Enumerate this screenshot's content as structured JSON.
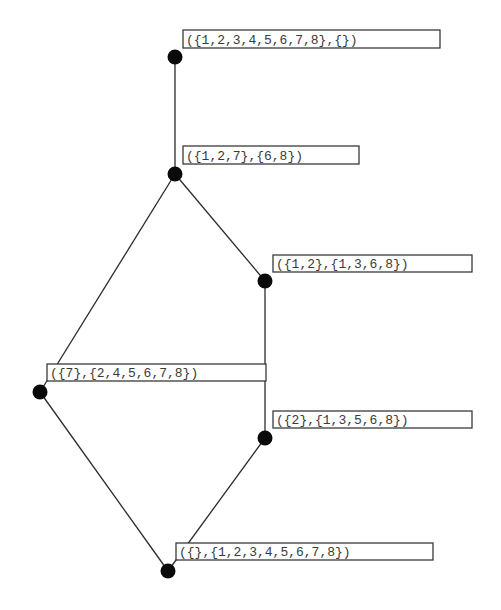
{
  "diagram": {
    "type": "lattice",
    "nodes": [
      {
        "id": "n1",
        "label": "({1,2,3,4,5,6,7,8},{})"
      },
      {
        "id": "n2",
        "label": "({1,2,7},{6,8})"
      },
      {
        "id": "n3",
        "label": "({1,2},{1,3,6,8})"
      },
      {
        "id": "n4",
        "label": "({7},{2,4,5,6,7,8})"
      },
      {
        "id": "n5",
        "label": "({2},{1,3,5,6,8})"
      },
      {
        "id": "n6",
        "label": "({},{1,2,3,4,5,6,7,8})"
      }
    ],
    "edges": [
      {
        "from": "n1",
        "to": "n2"
      },
      {
        "from": "n2",
        "to": "n3"
      },
      {
        "from": "n2",
        "to": "n4"
      },
      {
        "from": "n3",
        "to": "n5"
      },
      {
        "from": "n4",
        "to": "n6"
      },
      {
        "from": "n5",
        "to": "n6"
      }
    ]
  }
}
